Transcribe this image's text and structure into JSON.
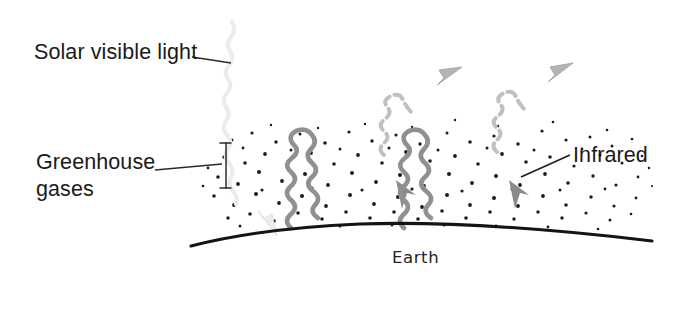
{
  "figure": {
    "type": "scientific-illustration",
    "width": 682,
    "height": 317,
    "background_color": "#ffffff"
  },
  "labels": {
    "solar_visible_light": "Solar visible light",
    "greenhouse_gases_line1": "Greenhouse",
    "greenhouse_gases_line2": "gases",
    "infrared": "Infrared",
    "earth": "Earth"
  },
  "colors": {
    "text": "#1a1a1a",
    "earth_line": "#141414",
    "atmosphere_light": "#e9e9e9",
    "atmosphere_mid": "#c8c8c8",
    "atmosphere_dark": "#bdbdbd",
    "gas_dot": "#1c1c1c",
    "infrared_ray": "#8f8f8f",
    "escaping_ray": "#bcbcbc",
    "solar_ray": "#ebebeb",
    "leader_line": "#2a2a2a"
  },
  "elements": {
    "solar_ray": {
      "name": "solar-visible-light-ray",
      "description": "pale wavy ray descending from upper-left into the atmosphere, ending in a light arrowhead at Earth's surface",
      "direction": "downward",
      "color": "#ebebeb"
    },
    "infrared_rays_reflected": {
      "name": "infrared-reflected-rays",
      "count": 2,
      "description": "grey wavy rays rising from Earth and bending back down with solid arrowheads",
      "direction": "up-then-down",
      "color": "#8f8f8f"
    },
    "infrared_rays_escaping": {
      "name": "infrared-escaping-rays",
      "count": 2,
      "description": "pale dashed-looking wavy rays escaping upward out of the atmosphere with arrowheads",
      "direction": "upward",
      "color": "#bcbcbc"
    },
    "gas_dots": {
      "name": "greenhouse-gas-dots",
      "description": "field of small dark dots representing greenhouse gas molecules in the lower atmosphere",
      "approximate_count": 150
    },
    "earth_surface": {
      "name": "earth-surface-curve",
      "description": "thick dark arc across the lower middle representing Earth's curved surface"
    },
    "greenhouse_bracket": {
      "name": "greenhouse-gases-bracket",
      "description": "vertical bracket marking the depth of the greenhouse gas layer"
    }
  },
  "leader_lines": [
    {
      "name": "solar-leader-line",
      "from_label": "Solar visible light",
      "to": "solar ray"
    },
    {
      "name": "greenhouse-leader-line",
      "from_label": "Greenhouse gases",
      "to": "gas layer bracket"
    },
    {
      "name": "infrared-leader-line",
      "from_label": "Infrared",
      "to": "descending infrared arrow"
    }
  ]
}
